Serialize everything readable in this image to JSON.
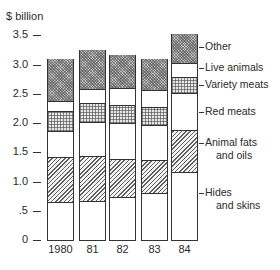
{
  "chart_data": {
    "type": "bar",
    "stacked": true,
    "title": "",
    "ylabel": "$ billion",
    "xlabel": "",
    "categories": [
      "1980",
      "81",
      "82",
      "83",
      "84"
    ],
    "ylim": [
      0,
      3.5
    ],
    "yticks": [
      "0",
      ".5",
      "1.0",
      "1.5",
      "2.0",
      "2.5",
      "3.0",
      "3.5"
    ],
    "ytick_values": [
      0,
      0.5,
      1.0,
      1.5,
      2.0,
      2.5,
      3.0,
      3.5
    ],
    "grid": false,
    "legend_position": "right, inline labels",
    "series": [
      {
        "name": "Hides and skins",
        "pattern": "white",
        "values": [
          0.65,
          0.67,
          0.74,
          0.8,
          1.16
        ]
      },
      {
        "name": "Animal fats and oils",
        "pattern": "diagonal-hatch",
        "values": [
          0.77,
          0.77,
          0.64,
          0.57,
          0.72
        ]
      },
      {
        "name": "Red meats",
        "pattern": "white",
        "values": [
          0.44,
          0.58,
          0.62,
          0.6,
          0.63
        ]
      },
      {
        "name": "Variety meats",
        "pattern": "cross-hatch",
        "values": [
          0.35,
          0.32,
          0.31,
          0.3,
          0.28
        ]
      },
      {
        "name": "Live animals",
        "pattern": "white",
        "values": [
          0.17,
          0.24,
          0.29,
          0.29,
          0.24
        ]
      },
      {
        "name": "Other",
        "pattern": "dense-dots",
        "values": [
          0.71,
          0.66,
          0.56,
          0.53,
          0.49
        ]
      }
    ],
    "totals": [
      3.09,
      3.24,
      3.16,
      3.09,
      3.52
    ]
  },
  "legend": {
    "other": "Other",
    "live": "Live animals",
    "variety": "Variety meats",
    "red": "Red meats",
    "fats_1": "Animal fats",
    "fats_2": "and oils",
    "hides_1": "Hides",
    "hides_2": "and skins"
  }
}
